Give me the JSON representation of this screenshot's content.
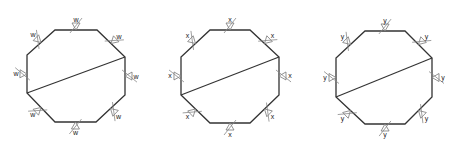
{
  "figures": [
    {
      "label": "w",
      "vertices": [
        [
          55,
          30
        ],
        [
          97,
          30
        ],
        [
          125,
          57
        ],
        [
          125,
          95
        ],
        [
          96,
          122
        ],
        [
          55,
          122
        ],
        [
          27,
          93
        ],
        [
          27,
          55
        ]
      ],
      "chord": [
        [
          125,
          57
        ],
        [
          27,
          93
        ]
      ]
    },
    {
      "label": "x",
      "vertices": [
        [
          210,
          30
        ],
        [
          250,
          30
        ],
        [
          279,
          57
        ],
        [
          279,
          95
        ],
        [
          250,
          123
        ],
        [
          210,
          123
        ],
        [
          181,
          95
        ],
        [
          181,
          57
        ]
      ],
      "chord": [
        [
          279,
          57
        ],
        [
          181,
          95
        ]
      ]
    },
    {
      "label": "y",
      "vertices": [
        [
          365,
          31
        ],
        [
          405,
          31
        ],
        [
          432,
          58
        ],
        [
          432,
          97
        ],
        [
          405,
          124
        ],
        [
          365,
          124
        ],
        [
          336,
          97
        ],
        [
          336,
          58
        ]
      ],
      "chord": [
        [
          432,
          58
        ],
        [
          336,
          97
        ]
      ]
    }
  ],
  "colors": {
    "edge": "#333333",
    "marker": "#777777",
    "label": "#222222",
    "background": "#ffffff"
  }
}
